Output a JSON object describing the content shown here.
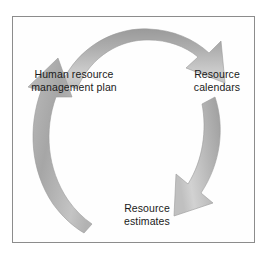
{
  "diagram": {
    "type": "cycle",
    "title": "",
    "border_color": "#8c8c8c",
    "background_color": "#ffffff",
    "arrow_color": "#a9a9a9",
    "arrow_color_light": "#d6d6d6",
    "arrow_color_dark": "#8f8f8f",
    "text_color": "#1a1a1a",
    "direction": "clockwise",
    "nodes": [
      {
        "id": "human-resource-management-plan",
        "position": "left",
        "lines": [
          "Human resource",
          "management plan"
        ]
      },
      {
        "id": "resource-calendars",
        "position": "right",
        "lines": [
          "Resource",
          "calendars"
        ]
      },
      {
        "id": "resource-estimates",
        "position": "bottom",
        "lines": [
          "Resource",
          "estimates"
        ]
      }
    ],
    "arrows": [
      {
        "id": "arrow-top",
        "from": "human-resource-management-plan",
        "to": "resource-calendars",
        "direction": "left-to-right-over-top",
        "head": "down-right"
      },
      {
        "id": "arrow-right",
        "from": "resource-calendars",
        "to": "resource-estimates",
        "direction": "top-to-bottom-on-right",
        "head": "down-left"
      },
      {
        "id": "arrow-left",
        "from": "resource-estimates",
        "to": "human-resource-management-plan",
        "direction": "bottom-to-top-on-left",
        "head": "up"
      }
    ]
  }
}
